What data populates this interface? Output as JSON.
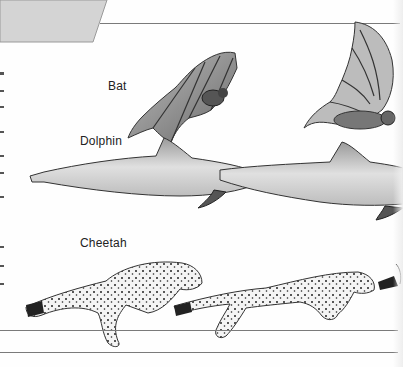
{
  "page": {
    "background": "#fefefe",
    "tab_color": "#d4d4d4",
    "rule_color": "#7a7a7a"
  },
  "labels": {
    "bat": "Bat",
    "dolphin": "Dolphin",
    "cheetah": "Cheetah"
  },
  "illustrations": [
    {
      "name": "bat",
      "count": 2
    },
    {
      "name": "dolphin",
      "count": 2
    },
    {
      "name": "cheetah",
      "count": 3
    }
  ]
}
